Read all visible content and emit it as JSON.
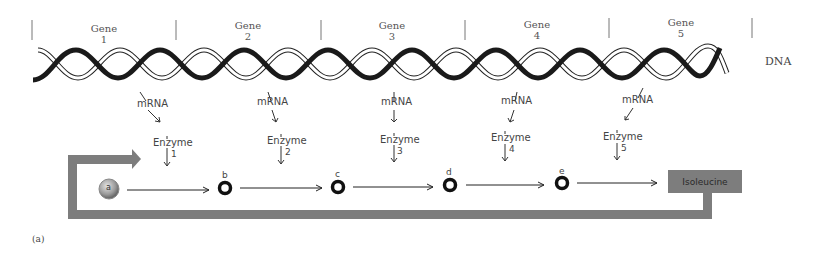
{
  "figure": {
    "panel_label": "(a)",
    "dna_label": "DNA",
    "genes": [
      {
        "label": "Gene",
        "number": "1"
      },
      {
        "label": "Gene",
        "number": "2"
      },
      {
        "label": "Gene",
        "number": "3"
      },
      {
        "label": "Gene",
        "number": "4"
      },
      {
        "label": "Gene",
        "number": "5"
      }
    ],
    "mrna_label": "mRNA",
    "enzymes": [
      {
        "label": "Enzyme",
        "number": "1"
      },
      {
        "label": "Enzyme",
        "number": "2"
      },
      {
        "label": "Enzyme",
        "number": "3"
      },
      {
        "label": "Enzyme",
        "number": "4"
      },
      {
        "label": "Enzyme",
        "number": "5"
      }
    ],
    "pathway": {
      "start": "a",
      "intermediates": [
        "b",
        "c",
        "d",
        "e"
      ],
      "product": "Isoleucine"
    },
    "colors": {
      "feedback": "#7d7d7d",
      "strand_dark": "#1a1a1a",
      "strand_light": "#ffffff",
      "text": "#444444"
    }
  }
}
